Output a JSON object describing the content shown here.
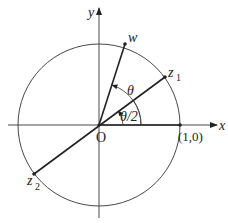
{
  "diagram": {
    "type": "unit-circle-complex-plane",
    "axes": {
      "x_label": "x",
      "y_label": "y",
      "origin_label": "O"
    },
    "points": {
      "w": {
        "label": "w",
        "subscript": ""
      },
      "z1": {
        "label": "z",
        "subscript": "1"
      },
      "z2": {
        "label": "z",
        "subscript": "2"
      },
      "unit": {
        "label": "(1,0)"
      }
    },
    "angles": {
      "theta": {
        "label": "θ"
      },
      "half_theta": {
        "label": "θ/2"
      }
    },
    "colors": {
      "stroke": "#222222",
      "background": "#ffffff"
    }
  }
}
